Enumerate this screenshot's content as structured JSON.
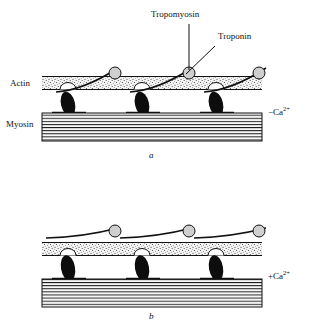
{
  "figure": {
    "title_labels": {
      "tropomyosin": "Tropomyosin",
      "troponin": "Troponin",
      "actin": "Actin",
      "myosin": "Myosin"
    },
    "panels": [
      {
        "letter": "a",
        "ion_sign": "−",
        "ion_element": "Ca",
        "ion_charge": "2+",
        "ion_full": "− Ca2+",
        "state": "relaxed",
        "tropomyosin_position": "blocking",
        "crossbridge_count": 3
      },
      {
        "letter": "b",
        "ion_sign": "+",
        "ion_element": "Ca",
        "ion_charge": "2+",
        "ion_full": "+ Ca2+",
        "state": "contracting",
        "tropomyosin_position": "shifted",
        "crossbridge_count": 3
      }
    ],
    "colors": {
      "outline": "#111111",
      "actin_fill": "#f2f2f2",
      "troponin_fill": "#cccccc",
      "myosin_head": "#0d0d0d",
      "background": "#ffffff"
    },
    "icons": {
      "tropomyosin_leader": "leader-line-icon",
      "troponin_leader": "leader-line-icon"
    }
  }
}
